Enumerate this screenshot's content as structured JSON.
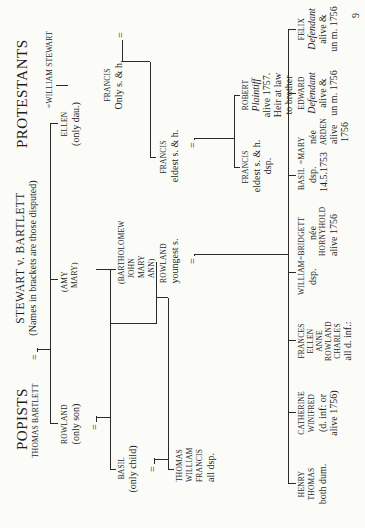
{
  "header": {
    "left_title": "POPISTS",
    "center_title": "STEWART v. BARTLETT",
    "center_subtitle": "(Names in brackets are those disputed)",
    "right_title": "PROTESTANTS"
  },
  "page_number": "9",
  "gen1": {
    "popist": "THOMAS BARTLETT",
    "protestant": "=WILLIAM STEWART",
    "marriage_symbol": "="
  },
  "gen2": {
    "rowland": {
      "name": "ROWLAND",
      "note": "(only son)"
    },
    "amy_mary": {
      "lines": [
        "(AMY",
        "MARY)"
      ]
    },
    "ellen": {
      "name": "ELLEN",
      "note": "(only dau.)"
    },
    "francis": {
      "name": "FRANCIS",
      "note": "Only s. & h."
    },
    "marriage_symbol": "="
  },
  "gen3": {
    "basil": {
      "name": "BASIL",
      "note": "(only child)"
    },
    "disputed": {
      "lines": [
        "(BARTHOLOMEW",
        "JOHN",
        "MARY",
        "ANN)"
      ]
    },
    "rowland": {
      "name": "ROWLAND",
      "note": "youngest s."
    },
    "francis": {
      "name": "FRANCIS",
      "note": "eldest s. & h."
    },
    "marriage_symbol": "="
  },
  "gen4": {
    "thomas_group": {
      "lines": [
        "THOMAS",
        "WILLIAM",
        "FRANCIS"
      ],
      "note": "all dsp."
    },
    "francis": {
      "name": "FRANCIS",
      "lines": [
        "eldest s. & h.",
        "dsp."
      ]
    },
    "robert": {
      "name": "ROBERT",
      "role": "Plaintiff",
      "lines": [
        "alive 1757.",
        "Heir at law",
        "to brother"
      ]
    }
  },
  "gen5": [
    {
      "names": [
        "HENRY",
        "THOMAS"
      ],
      "notes": [
        "both dum."
      ]
    },
    {
      "names": [
        "CATHERINE",
        "WINIFRED"
      ],
      "notes": [
        "(d. inf: or",
        "alive 1756)"
      ]
    },
    {
      "names": [
        "FRANCES",
        "ELLEN",
        "ANNE",
        "ROWLAND",
        "CHARLES"
      ],
      "notes": [
        "all d. inf.:"
      ]
    },
    {
      "names": [
        "WILLIAM"
      ],
      "notes": [
        "dsp."
      ],
      "spouse": "=BRIDGETT",
      "spouse_notes": [
        "née"
      ],
      "spouse_family": "HORNYHOLD",
      "spouse_extra": "alive 1756"
    },
    {
      "names": [
        "BASIL"
      ],
      "notes": [
        "dsp.",
        "14.5.1753"
      ],
      "spouse": "=MARY",
      "spouse_notes": [
        "née"
      ],
      "spouse_family": "ARDEN",
      "spouse_extra": "alive",
      "spouse_extra2": "1756"
    },
    {
      "names": [
        "EDWARD"
      ],
      "role": "Defendant",
      "notes": [
        "alive &",
        "un m. 1756"
      ]
    },
    {
      "names": [
        "FELIX"
      ],
      "role": "Defendant",
      "notes": [
        "alive &",
        "un m. 1756"
      ]
    }
  ]
}
